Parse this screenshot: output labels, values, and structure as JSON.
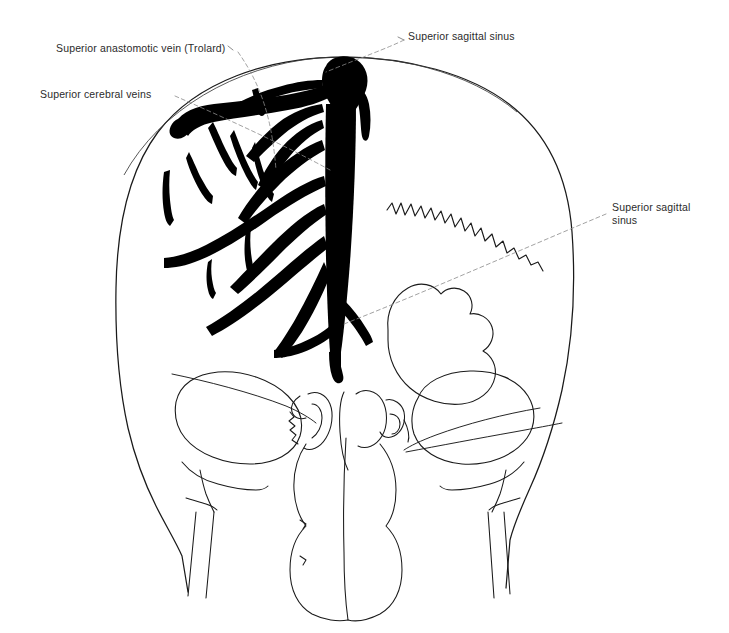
{
  "figure": {
    "background_color": "#ffffff",
    "ink_color": "#000000",
    "outline_color": "#1a1a1a",
    "text_color": "#2b2b2b",
    "leader_color": "#8a8a8a"
  },
  "labels": [
    {
      "id": "superior-anastomotic-vein",
      "text": "Superior anastomotic vein (Trolard)",
      "lines": [
        "Superior anastomotic vein (Trolard)"
      ],
      "x": 56,
      "y": 42
    },
    {
      "id": "superior-cerebral-veins",
      "text": "Superior cerebral veins",
      "lines": [
        "Superior cerebral veins"
      ],
      "x": 40,
      "y": 88
    },
    {
      "id": "superior-sagittal-sinus-top",
      "text": "Superior sagittal sinus",
      "lines": [
        "Superior sagittal sinus"
      ],
      "x": 408,
      "y": 30
    },
    {
      "id": "superior-sagittal-sinus-right",
      "text": "Superior sagittal\nsinus",
      "lines": [
        "Superior sagittal",
        "sinus"
      ],
      "x": 612,
      "y": 201
    }
  ],
  "structures": [
    {
      "id": "skull-outline",
      "name": "Skull outline (anterior view)"
    },
    {
      "id": "superior-sagittal-sinus",
      "name": "Superior sagittal sinus (midline venous trunk)"
    },
    {
      "id": "superior-cerebral-veins",
      "name": "Superior cerebral veins (branching tree, left hemisphere)"
    },
    {
      "id": "superior-anastomotic-vein",
      "name": "Superior anastomotic vein of Trolard"
    },
    {
      "id": "coronal-suture",
      "name": "Serrated suture line (right side)"
    },
    {
      "id": "orbit-left",
      "name": "Left orbital rim"
    },
    {
      "id": "orbit-right",
      "name": "Right orbital rim"
    },
    {
      "id": "nasal-cavity",
      "name": "Nasal cavity and septum"
    },
    {
      "id": "nasal-turbinates",
      "name": "Nasal turbinates / ethmoid region"
    },
    {
      "id": "zygomatic-arch-left",
      "name": "Left zygomatic process"
    },
    {
      "id": "zygomatic-arch-right",
      "name": "Right zygomatic process"
    },
    {
      "id": "sphenoid-wing",
      "name": "Sphenoid / petrous reference lines"
    }
  ]
}
